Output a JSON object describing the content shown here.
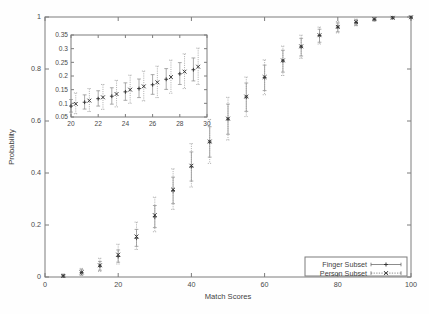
{
  "chart_data": {
    "type": "scatter",
    "title": "",
    "xlabel": "Match Scores",
    "ylabel": "Probability",
    "xlim": [
      0,
      100
    ],
    "ylim": [
      0,
      1
    ],
    "xticks": [
      "0",
      "20",
      "40",
      "60",
      "80",
      "100"
    ],
    "xtick_values": [
      0,
      20,
      40,
      60,
      80,
      100
    ],
    "yticks": [
      "0",
      "0.2",
      "0.4",
      "0.6",
      "0.8",
      "1"
    ],
    "ytick_values": [
      0,
      0.2,
      0.4,
      0.6,
      0.8,
      1
    ],
    "grid": false,
    "legend_position": "bottom-right",
    "error_bars": true,
    "series": [
      {
        "name": "Finger Subset",
        "marker": "plus",
        "linestyle": "solid",
        "x": [
          5,
          10,
          15,
          20,
          25,
          30,
          35,
          40,
          45,
          50,
          55,
          60,
          65,
          70,
          75,
          80,
          85,
          90,
          95,
          100
        ],
        "values": [
          0.004,
          0.017,
          0.042,
          0.079,
          0.149,
          0.231,
          0.332,
          0.424,
          0.519,
          0.607,
          0.692,
          0.767,
          0.831,
          0.885,
          0.929,
          0.961,
          0.979,
          0.991,
          0.997,
          0.999
        ],
        "err_low": [
          0.004,
          0.009,
          0.016,
          0.022,
          0.031,
          0.041,
          0.05,
          0.055,
          0.058,
          0.058,
          0.055,
          0.05,
          0.043,
          0.035,
          0.026,
          0.018,
          0.011,
          0.006,
          0.003,
          0.001
        ],
        "err_high": [
          0.006,
          0.011,
          0.018,
          0.025,
          0.034,
          0.044,
          0.052,
          0.057,
          0.059,
          0.058,
          0.054,
          0.048,
          0.041,
          0.033,
          0.024,
          0.016,
          0.01,
          0.005,
          0.002,
          0.001
        ]
      },
      {
        "name": "Person Subset",
        "marker": "cross",
        "linestyle": "dashed",
        "x": [
          5,
          10,
          15,
          20,
          25,
          30,
          35,
          40,
          45,
          50,
          55,
          60,
          65,
          70,
          75,
          80,
          85,
          90,
          95,
          100
        ],
        "values": [
          0.004,
          0.018,
          0.045,
          0.086,
          0.156,
          0.238,
          0.336,
          0.428,
          0.521,
          0.609,
          0.694,
          0.769,
          0.833,
          0.887,
          0.93,
          0.962,
          0.98,
          0.992,
          0.997,
          0.999
        ],
        "err_low": [
          0.004,
          0.012,
          0.024,
          0.036,
          0.05,
          0.064,
          0.076,
          0.082,
          0.084,
          0.082,
          0.077,
          0.068,
          0.058,
          0.046,
          0.034,
          0.023,
          0.014,
          0.007,
          0.003,
          0.001
        ],
        "err_high": [
          0.008,
          0.015,
          0.027,
          0.04,
          0.055,
          0.069,
          0.08,
          0.085,
          0.085,
          0.082,
          0.075,
          0.066,
          0.055,
          0.043,
          0.031,
          0.02,
          0.012,
          0.006,
          0.002,
          0.001
        ]
      }
    ],
    "inset": {
      "type": "scatter",
      "xlabel": "",
      "ylabel": "",
      "xlim": [
        20,
        30
      ],
      "ylim": [
        0.05,
        0.35
      ],
      "xticks": [
        "20",
        "22",
        "24",
        "26",
        "28",
        "30"
      ],
      "xtick_values": [
        20,
        22,
        24,
        26,
        28,
        30
      ],
      "yticks": [
        "0.05",
        "0.1",
        "0.15",
        "0.2",
        "0.25",
        "0.3",
        "0.35"
      ],
      "ytick_values": [
        0.05,
        0.1,
        0.15,
        0.2,
        0.25,
        0.3,
        0.35
      ],
      "grid": false,
      "error_bars": true,
      "series": [
        {
          "name": "Finger Subset",
          "marker": "plus",
          "linestyle": "solid",
          "x": [
            20,
            21,
            22,
            23,
            24,
            25,
            26,
            27,
            28,
            29
          ],
          "values": [
            0.09,
            0.104,
            0.117,
            0.126,
            0.142,
            0.154,
            0.168,
            0.188,
            0.208,
            0.223
          ],
          "err_low": [
            0.022,
            0.025,
            0.027,
            0.029,
            0.031,
            0.033,
            0.035,
            0.037,
            0.039,
            0.041
          ],
          "err_high": [
            0.024,
            0.027,
            0.029,
            0.031,
            0.033,
            0.035,
            0.037,
            0.039,
            0.041,
            0.043
          ]
        },
        {
          "name": "Person Subset",
          "marker": "cross",
          "linestyle": "dashed",
          "x": [
            20.35,
            21.35,
            22.35,
            23.35,
            24.35,
            25.35,
            26.35,
            27.35,
            28.35,
            29.35
          ],
          "values": [
            0.098,
            0.11,
            0.122,
            0.134,
            0.15,
            0.162,
            0.177,
            0.196,
            0.216,
            0.234
          ],
          "err_low": [
            0.036,
            0.04,
            0.044,
            0.047,
            0.05,
            0.053,
            0.056,
            0.059,
            0.062,
            0.065
          ],
          "err_high": [
            0.04,
            0.044,
            0.047,
            0.05,
            0.053,
            0.056,
            0.059,
            0.062,
            0.065,
            0.068
          ]
        }
      ]
    },
    "legend": [
      {
        "label": "Finger Subset",
        "marker": "plus",
        "linestyle": "solid"
      },
      {
        "label": "Person Subset",
        "marker": "cross",
        "linestyle": "dashed"
      }
    ]
  },
  "colors": {
    "axis": "#7c7c7c",
    "text": "#3f3f3f",
    "marker": "#343434",
    "errorbar": "#8d8d8d",
    "background": "#fefefe"
  }
}
